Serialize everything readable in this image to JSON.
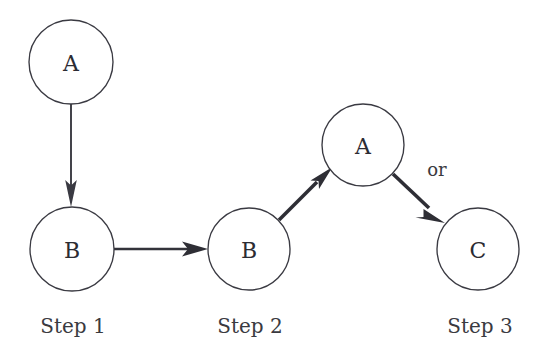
{
  "diagram": {
    "canvas": {
      "width": 540,
      "height": 364
    },
    "stroke_color": "#3a3a42",
    "fill_color": "#ffffff",
    "text_color": "#2c2c33",
    "nodes": [
      {
        "id": "a1",
        "label": "A",
        "cx": 71,
        "cy": 62,
        "r": 42,
        "step": "Step 1"
      },
      {
        "id": "b1",
        "label": "B",
        "cx": 72,
        "cy": 249,
        "r": 42,
        "step": "Step 1"
      },
      {
        "id": "b2",
        "label": "B",
        "cx": 249,
        "cy": 249,
        "r": 41,
        "step": "Step 2"
      },
      {
        "id": "a2",
        "label": "A",
        "cx": 363,
        "cy": 145,
        "r": 41,
        "step": "Step 3"
      },
      {
        "id": "c1",
        "label": "C",
        "cx": 478,
        "cy": 249,
        "r": 41,
        "step": "Step 3"
      }
    ],
    "edges": [
      {
        "id": "e1",
        "from": "a1",
        "to": "b1",
        "style": "thin",
        "direction": "down"
      },
      {
        "id": "e2",
        "from": "b1",
        "to": "b2",
        "style": "medium",
        "direction": "right"
      },
      {
        "id": "e3",
        "from": "b2",
        "to": "a2",
        "style": "thick",
        "direction": "up-right"
      },
      {
        "id": "e4",
        "from": "a2",
        "to": "c1",
        "style": "thick",
        "direction": "down-right"
      }
    ],
    "edge_labels": [
      {
        "id": "or",
        "text": "or",
        "x": 437,
        "y": 176
      }
    ],
    "step_labels": [
      {
        "id": "step1",
        "text": "Step 1",
        "x": 73,
        "y": 333
      },
      {
        "id": "step2",
        "text": "Step 2",
        "x": 250,
        "y": 333
      },
      {
        "id": "step3",
        "text": "Step 3",
        "x": 480,
        "y": 333
      }
    ]
  }
}
